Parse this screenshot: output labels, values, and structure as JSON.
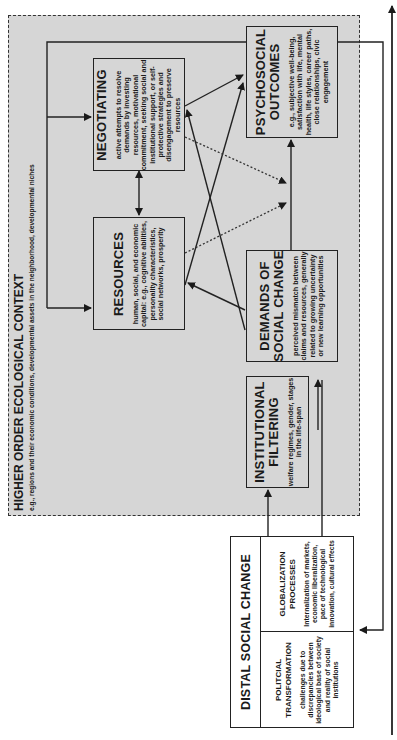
{
  "context": {
    "title": "HIGHER ORDER ECOLOGICAL CONTEXT",
    "subtitle": "e.g., regions and their economic conditions, developmental assets in the neighborhood, developmental niches"
  },
  "nodes": {
    "negotiating": {
      "title": "NEGOTIATING",
      "description": "active attempts to resolve demands by investing resources, motivational commitment, seeking social and institutional support, or self-protective strategies and disengagement to preserve resources"
    },
    "resources": {
      "title": "RESOURCES",
      "description": "human, social, and economic capital: e.g., cognitive abilities, personality characteristics, social networks, prosperity"
    },
    "psychosocial_outcomes": {
      "title_line1": "PSYCHOSOCIAL",
      "title_line2": "OUTCOMES",
      "description": "e.g., subjective well-being, satisfaction with life, mental health, life styles, career paths, close relationships, civic engagement"
    },
    "demands": {
      "title_line1": "DEMANDS OF",
      "title_line2": "SOCIAL CHANGE",
      "description": "perceived mismatch between claims and resources, generally related to growing uncertainty or new learning opportunities"
    },
    "institutional_filtering": {
      "title_line1": "INSTITUTIONAL",
      "title_line2": "FILTERING",
      "description": "welfare regimes, gender, stages in the life-span"
    },
    "distal_social_change": {
      "title": "DISTAL SOCIAL CHANGE",
      "political": {
        "title_line1": "POLITCIAL",
        "title_line2": "TRANSFORMATION",
        "description": "challenges due to discrepancies between ideological base of society and reality of social institutions"
      },
      "globalization": {
        "title_line1": "GLOBALIZATION",
        "title_line2": "PROCESSES",
        "description": "Internalization of markets, economic liberalization, pace of technological innovation, cultural effects"
      }
    }
  },
  "edges": [
    {
      "from": "distal_social_change",
      "to": "institutional_filtering",
      "style": "solid"
    },
    {
      "from": "distal_social_change",
      "to": "demands",
      "style": "solid"
    },
    {
      "from": "institutional_filtering",
      "to": "demands",
      "style": "solid"
    },
    {
      "from": "demands",
      "to": "psychosocial_outcomes",
      "style": "solid"
    },
    {
      "from": "demands",
      "to": "resources",
      "style": "solid"
    },
    {
      "from": "demands",
      "to": "negotiating",
      "style": "solid"
    },
    {
      "from": "resources",
      "to": "psychosocial_outcomes",
      "style": "solid"
    },
    {
      "from": "negotiating",
      "to": "psychosocial_outcomes",
      "style": "solid"
    },
    {
      "from": "resources",
      "to": "negotiating",
      "style": "solid-bidirectional"
    },
    {
      "from": "negotiating",
      "to": "demands->psychosocial_outcomes",
      "style": "dotted"
    },
    {
      "from": "resources",
      "to": "demands->psychosocial_outcomes",
      "style": "dotted"
    },
    {
      "from": "psychosocial_outcomes",
      "to": "negotiating",
      "style": "solid-feedback"
    },
    {
      "from": "psychosocial_outcomes",
      "to": "resources",
      "style": "solid-feedback"
    },
    {
      "from": "psychosocial_outcomes",
      "to": "distal_social_change",
      "style": "solid-feedback"
    }
  ],
  "colors": {
    "context_fill": "#d6d6d6",
    "line": "#222222",
    "background": "#ffffff"
  }
}
